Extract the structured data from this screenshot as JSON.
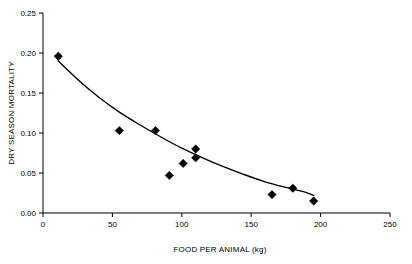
{
  "chart_data": {
    "type": "scatter",
    "title": "",
    "xlabel": "FOOD PER ANIMAL (kg)",
    "ylabel": "DRY SEASON MORTALITY",
    "xlim": [
      0,
      250
    ],
    "ylim": [
      0.0,
      0.25
    ],
    "xticks": [
      0,
      50,
      100,
      150,
      200,
      250
    ],
    "xtick_labels": [
      "0",
      "50",
      "100",
      "150",
      "200",
      "250"
    ],
    "yticks": [
      0.0,
      0.05,
      0.1,
      0.15,
      0.2,
      0.25
    ],
    "ytick_labels": [
      "0.00",
      "0.05",
      "0.10",
      "0.15",
      "0.20",
      "0.25"
    ],
    "grid": false,
    "legend": false,
    "marker": "diamond",
    "marker_color": "#000000",
    "points": [
      {
        "x": 11,
        "y": 0.196
      },
      {
        "x": 55,
        "y": 0.103
      },
      {
        "x": 81,
        "y": 0.103
      },
      {
        "x": 91,
        "y": 0.047
      },
      {
        "x": 101,
        "y": 0.062
      },
      {
        "x": 110,
        "y": 0.08
      },
      {
        "x": 110,
        "y": 0.069
      },
      {
        "x": 165,
        "y": 0.023
      },
      {
        "x": 180,
        "y": 0.031
      },
      {
        "x": 195,
        "y": 0.015
      }
    ],
    "fit_curve": {
      "label": "exponential decline trend",
      "points": [
        {
          "x": 11,
          "y": 0.19
        },
        {
          "x": 25,
          "y": 0.167
        },
        {
          "x": 40,
          "y": 0.145
        },
        {
          "x": 55,
          "y": 0.126
        },
        {
          "x": 70,
          "y": 0.11
        },
        {
          "x": 85,
          "y": 0.095
        },
        {
          "x": 100,
          "y": 0.081
        },
        {
          "x": 115,
          "y": 0.069
        },
        {
          "x": 130,
          "y": 0.058
        },
        {
          "x": 145,
          "y": 0.048
        },
        {
          "x": 160,
          "y": 0.039
        },
        {
          "x": 175,
          "y": 0.032
        },
        {
          "x": 187,
          "y": 0.027
        },
        {
          "x": 195,
          "y": 0.022
        }
      ]
    }
  },
  "caption": {
    "text": ""
  }
}
